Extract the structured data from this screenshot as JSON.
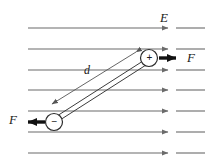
{
  "figure": {
    "background_color": "#ffffff",
    "width": 209,
    "height": 165
  },
  "labels": {
    "field_label": "E",
    "separation_label": "d",
    "force_right_label": "F",
    "force_left_label": "F",
    "positive_sign": "+",
    "negative_sign": "−"
  },
  "colors": {
    "field_line": "#6b6b6b",
    "dipole_rod": "#3c3c3c",
    "force_arrow": "#111111",
    "charge_outline": "#2b2b2b",
    "text": "#1a1a1a",
    "dimension_line": "#555555"
  },
  "field": {
    "line_count": 7,
    "direction": "right",
    "x_start": 28,
    "x_end": 205,
    "arrow_x": 172,
    "line_y_values": [
      28,
      49,
      70,
      90,
      111,
      132,
      153
    ]
  },
  "charges": {
    "positive": {
      "label": "+",
      "cx": 149,
      "cy": 58,
      "r": 9
    },
    "negative": {
      "label": "−",
      "cx": 54,
      "cy": 122,
      "r": 9
    }
  },
  "forces": {
    "right": {
      "label": "F",
      "from_x": 160,
      "to_x": 184,
      "y": 58,
      "direction": "right"
    },
    "left": {
      "label": "F",
      "from_x": 44,
      "to_x": 20,
      "y": 122,
      "direction": "left"
    }
  },
  "dimension": {
    "label": "d",
    "from_x": 140,
    "from_y": 50,
    "to_x": 46,
    "to_y": 107,
    "label_x": 84,
    "label_y": 66
  }
}
